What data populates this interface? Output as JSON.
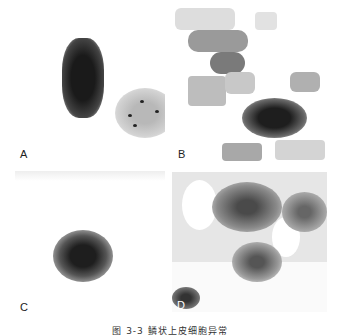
{
  "figure": {
    "panels": [
      {
        "label": "A"
      },
      {
        "label": "B"
      },
      {
        "label": "C"
      },
      {
        "label": "D"
      }
    ],
    "caption": "图 3-3   鳞状上皮细胞异常"
  }
}
